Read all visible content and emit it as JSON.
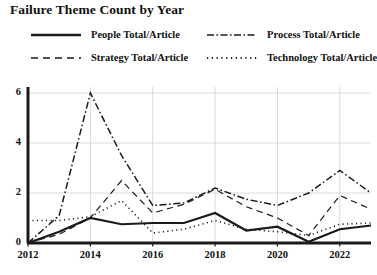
{
  "chart_data": {
    "type": "line",
    "title": "Failure Theme Count by Year",
    "xlabel": "",
    "ylabel": "",
    "x": [
      2012,
      2013,
      2014,
      2015,
      2016,
      2017,
      2018,
      2019,
      2020,
      2021,
      2022,
      2023
    ],
    "xlim": [
      2012,
      2023
    ],
    "ylim": [
      0,
      6.4
    ],
    "xticks": [
      2012,
      2014,
      2016,
      2018,
      2020,
      2022
    ],
    "xtick_labels": [
      "2012",
      "2014",
      "2016",
      "2018",
      "2020",
      "2022"
    ],
    "yticks": [
      0,
      2,
      4,
      6
    ],
    "ytick_labels": [
      "0",
      "2",
      "4",
      "6"
    ],
    "grid": true,
    "legend_position": "top",
    "legend_columns": 2,
    "series": [
      {
        "name": "People Total/Article",
        "style": "solid",
        "color": "#1a1a1a",
        "width": 2.2,
        "values": [
          0.0,
          0.45,
          1.0,
          0.75,
          0.8,
          0.8,
          1.2,
          0.5,
          0.65,
          0.05,
          0.55,
          0.7
        ]
      },
      {
        "name": "Process Total/Article",
        "style": "dashdot",
        "color": "#1a1a1a",
        "width": 1.5,
        "values": [
          0.0,
          1.1,
          6.0,
          3.5,
          1.5,
          1.6,
          2.2,
          1.75,
          1.5,
          2.0,
          2.9,
          2.0
        ]
      },
      {
        "name": "Strategy Total/Article",
        "style": "dashed",
        "color": "#1a1a1a",
        "width": 1.2,
        "values": [
          0.0,
          0.35,
          1.0,
          2.5,
          1.2,
          1.55,
          2.15,
          1.45,
          1.0,
          0.3,
          1.9,
          1.35
        ]
      },
      {
        "name": "Technology Total/Article",
        "style": "dotted",
        "color": "#1a1a1a",
        "width": 1.6,
        "values": [
          0.9,
          0.9,
          1.05,
          1.7,
          0.4,
          0.55,
          0.9,
          0.55,
          0.45,
          0.3,
          0.75,
          0.8
        ]
      }
    ]
  },
  "axes": {
    "ytick_labels": [
      "6",
      "4",
      "2",
      "0"
    ],
    "xtick_labels": [
      "2012",
      "2014",
      "2016",
      "2018",
      "2020",
      "2022"
    ]
  },
  "legend": {
    "items": [
      {
        "label": "People Total/Article",
        "style": "solid"
      },
      {
        "label": "Process Total/Article",
        "style": "dashdot"
      },
      {
        "label": "Strategy Total/Article",
        "style": "dashed"
      },
      {
        "label": "Technology Total/Article",
        "style": "dotted"
      }
    ]
  }
}
